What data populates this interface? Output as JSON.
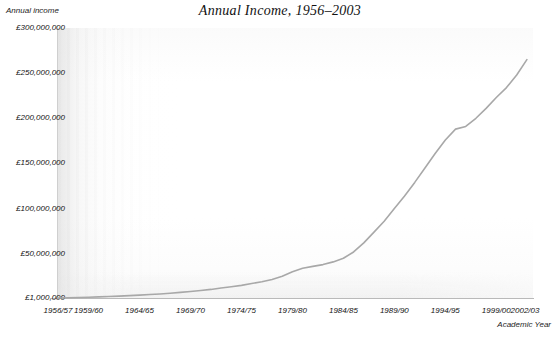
{
  "chart_data": {
    "type": "line",
    "title": "Annual Income, 1956–2003",
    "xlabel": "Academic Year",
    "ylabel": "Annual income",
    "ylim": [
      1000000,
      300000000
    ],
    "grid": false,
    "legend": "none",
    "currency": "GBP",
    "y_ticks": [
      "£300,000,000",
      "£250,000,000",
      "£200,000,000",
      "£150,000,000",
      "£100,000,000",
      "£50,000,000",
      "£1,000,000"
    ],
    "y_tick_values": [
      300000000,
      250000000,
      200000000,
      150000000,
      100000000,
      50000000,
      1000000
    ],
    "x_tick_labels": [
      "1956/57",
      "1959/60",
      "1964/65",
      "1969/70",
      "1974/75",
      "1979/80",
      "1984/85",
      "1989/90",
      "1994/95",
      "1999/00",
      "2002/03"
    ],
    "x_tick_values": [
      1956,
      1959,
      1964,
      1969,
      1974,
      1979,
      1984,
      1989,
      1994,
      1999,
      2002
    ],
    "series": [
      {
        "name": "Annual income",
        "color": "#a8a8a8",
        "x": [
          1956,
          1957,
          1958,
          1959,
          1960,
          1961,
          1962,
          1963,
          1964,
          1965,
          1966,
          1967,
          1968,
          1969,
          1970,
          1971,
          1972,
          1973,
          1974,
          1975,
          1976,
          1977,
          1978,
          1979,
          1980,
          1981,
          1982,
          1983,
          1984,
          1985,
          1986,
          1987,
          1988,
          1989,
          1990,
          1991,
          1992,
          1993,
          1994,
          1995,
          1996,
          1997,
          1998,
          1999,
          2000,
          2001,
          2002
        ],
        "values": [
          1000000,
          1200000,
          1500000,
          1800000,
          2200000,
          2600000,
          3100000,
          3600000,
          4200000,
          4800000,
          5500000,
          6300000,
          7200000,
          8200000,
          9300000,
          10500000,
          12000000,
          13500000,
          15000000,
          17000000,
          19000000,
          21500000,
          25000000,
          30000000,
          34000000,
          36000000,
          38000000,
          41000000,
          45000000,
          52000000,
          62000000,
          74000000,
          86000000,
          100000000,
          114000000,
          129000000,
          145000000,
          161000000,
          176000000,
          188000000,
          191000000,
          200000000,
          211000000,
          223000000,
          234000000,
          248000000,
          265000000
        ]
      }
    ]
  }
}
